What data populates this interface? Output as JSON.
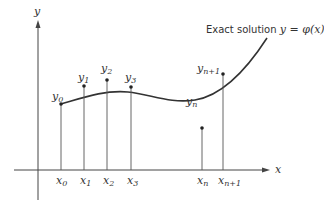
{
  "diagram": {
    "axes": {
      "x_label": "x",
      "y_label": "y"
    },
    "curve_label": {
      "prefix": "Exact solution ",
      "equation": "y = φ(x)"
    },
    "x_ticks": [
      {
        "base": "x",
        "sub": "0"
      },
      {
        "base": "x",
        "sub": "1"
      },
      {
        "base": "x",
        "sub": "2"
      },
      {
        "base": "x",
        "sub": "3"
      },
      {
        "base": "x",
        "sub": "n"
      },
      {
        "base": "x",
        "sub": "n+1"
      }
    ],
    "y_points": [
      {
        "base": "y",
        "sub": "0"
      },
      {
        "base": "y",
        "sub": "1"
      },
      {
        "base": "y",
        "sub": "2"
      },
      {
        "base": "y",
        "sub": "3"
      },
      {
        "base": "y",
        "sub": "n"
      },
      {
        "base": "y",
        "sub": "n+1"
      }
    ],
    "colors": {
      "ink": "#333333",
      "background": "#ffffff"
    }
  }
}
